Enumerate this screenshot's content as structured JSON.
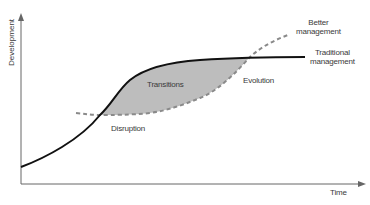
{
  "diagram": {
    "axes": {
      "y_label": "Development",
      "x_label": "Time"
    },
    "curves": [
      {
        "name": "Traditional management",
        "style": "solid",
        "color": "#111111"
      },
      {
        "name": "Better management",
        "style": "dashed",
        "color": "#8a8a8a"
      }
    ],
    "regions": [
      {
        "name": "Transitions",
        "fill": "#bdbdbd"
      }
    ],
    "labels": {
      "better_line1": "Better",
      "better_line2": "management",
      "traditional_line1": "Traditional",
      "traditional_line2": "management",
      "transitions": "Transitions",
      "evolution": "Evolution",
      "disruption": "Disruption"
    },
    "colors": {
      "axis": "#666666",
      "solid_curve": "#111111",
      "dashed_curve": "#8a8a8a",
      "shaded_area": "#bdbdbd"
    }
  }
}
